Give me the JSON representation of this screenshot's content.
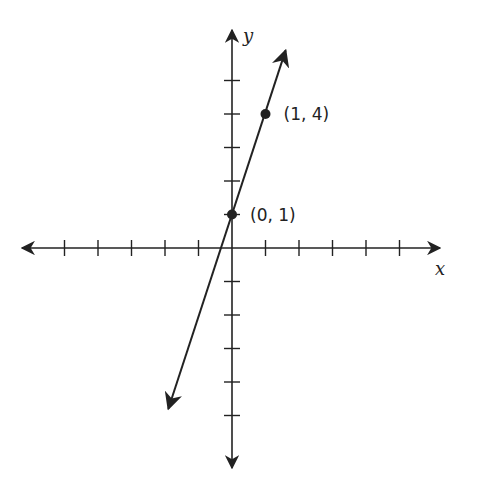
{
  "chart_data": {
    "type": "line",
    "title": "",
    "xlabel": "x",
    "ylabel": "y",
    "xlim": [
      -6,
      6
    ],
    "ylim": [
      -6,
      6
    ],
    "grid": false,
    "ticks": {
      "x": [
        -5,
        -4,
        -3,
        -2,
        -1,
        1,
        2,
        3,
        4,
        5
      ],
      "y": [
        -5,
        -4,
        -3,
        -2,
        -1,
        1,
        2,
        3,
        4,
        5
      ]
    },
    "series": [
      {
        "name": "y = 3x + 1",
        "slope": 3,
        "intercept": 1,
        "x": [
          -1.9,
          1.6
        ],
        "y": [
          -4.8,
          5.9
        ],
        "arrows": "both"
      }
    ],
    "points": [
      {
        "x": 0,
        "y": 1,
        "label": "(0, 1)"
      },
      {
        "x": 1,
        "y": 4,
        "label": "(1, 4)"
      }
    ]
  },
  "labels": {
    "x_axis": "x",
    "y_axis": "y",
    "point_a": "(0, 1)",
    "point_b": "(1, 4)"
  },
  "colors": {
    "ink": "#222222",
    "background": "#ffffff"
  }
}
